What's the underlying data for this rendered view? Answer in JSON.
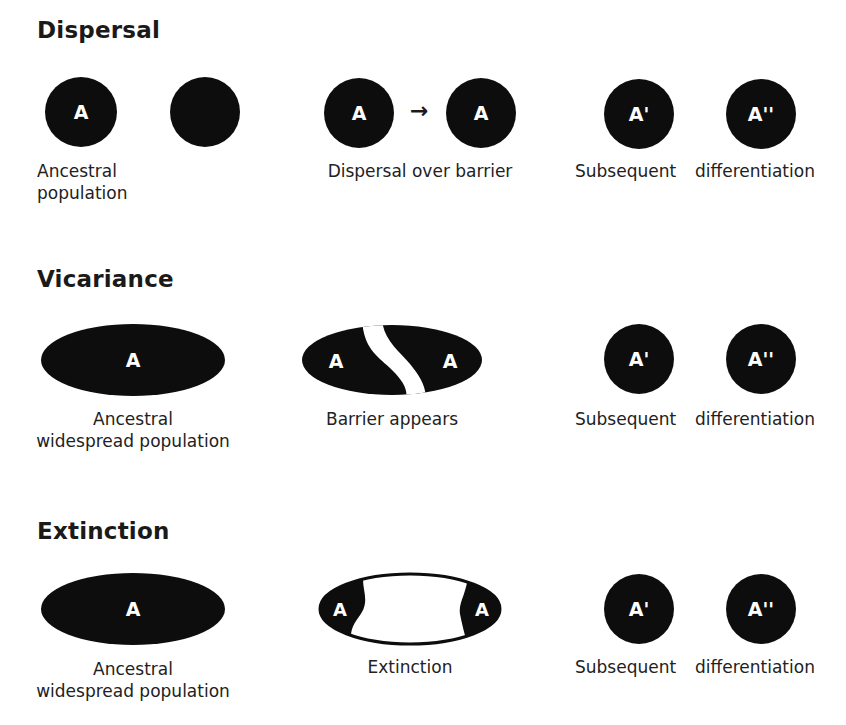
{
  "sections": [
    {
      "title": "Dispersal",
      "nodes": [
        "A",
        "",
        "A",
        "A",
        "A'",
        "A''"
      ],
      "arrow": "→",
      "labels": [
        "Ancestral population",
        "Dispersal over barrier",
        "Subsequent",
        "differentiation"
      ],
      "label_lines": [
        "Ancestral",
        "population"
      ]
    },
    {
      "title": "Vicariance",
      "nodes": [
        "A",
        "A",
        "A",
        "A'",
        "A''"
      ],
      "labels": [
        "Ancestral widespread population",
        "Barrier appears",
        "Subsequent",
        "differentiation"
      ],
      "label_lines": [
        "Ancestral",
        "widespread population"
      ]
    },
    {
      "title": "Extinction",
      "nodes": [
        "A",
        "A",
        "A",
        "A'",
        "A''"
      ],
      "labels": [
        "Ancestral widespread population",
        "Extinction",
        "Subsequent",
        "differentiation"
      ],
      "label_lines": [
        "Ancestral",
        "widespread population"
      ]
    }
  ],
  "colors": {
    "fill": "#0d0d0d",
    "text": "#ffffff",
    "background": "#ffffff"
  }
}
